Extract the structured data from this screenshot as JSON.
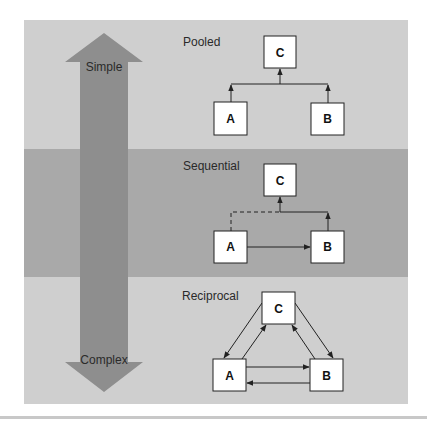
{
  "colors": {
    "band_light": "#cfcfcf",
    "band_dark": "#a9a9a9",
    "arrow": "#8e8e8e",
    "box_fill": "#ffffff",
    "stroke": "#222222",
    "label": "#2a2a2a"
  },
  "axis_arrow": {
    "top_label": "Simple",
    "bottom_label": "Complex"
  },
  "panels": [
    {
      "title": "Pooled",
      "nodes": [
        {
          "id": "C",
          "label": "C"
        },
        {
          "id": "A",
          "label": "A"
        },
        {
          "id": "B",
          "label": "B"
        }
      ],
      "edges": [
        {
          "from": "A",
          "to": "C",
          "style": "solid"
        },
        {
          "from": "B",
          "to": "C",
          "style": "solid"
        }
      ]
    },
    {
      "title": "Sequential",
      "nodes": [
        {
          "id": "C",
          "label": "C"
        },
        {
          "id": "A",
          "label": "A"
        },
        {
          "id": "B",
          "label": "B"
        }
      ],
      "edges": [
        {
          "from": "A",
          "to": "C",
          "style": "dashed"
        },
        {
          "from": "A",
          "to": "B",
          "style": "solid"
        },
        {
          "from": "B",
          "to": "C",
          "style": "solid"
        }
      ]
    },
    {
      "title": "Reciprocal",
      "nodes": [
        {
          "id": "C",
          "label": "C"
        },
        {
          "id": "A",
          "label": "A"
        },
        {
          "id": "B",
          "label": "B"
        }
      ],
      "edges": [
        {
          "from": "C",
          "to": "A",
          "style": "solid"
        },
        {
          "from": "A",
          "to": "C",
          "style": "solid"
        },
        {
          "from": "C",
          "to": "B",
          "style": "solid"
        },
        {
          "from": "B",
          "to": "C",
          "style": "solid"
        },
        {
          "from": "A",
          "to": "B",
          "style": "solid"
        },
        {
          "from": "B",
          "to": "A",
          "style": "solid"
        }
      ]
    }
  ]
}
